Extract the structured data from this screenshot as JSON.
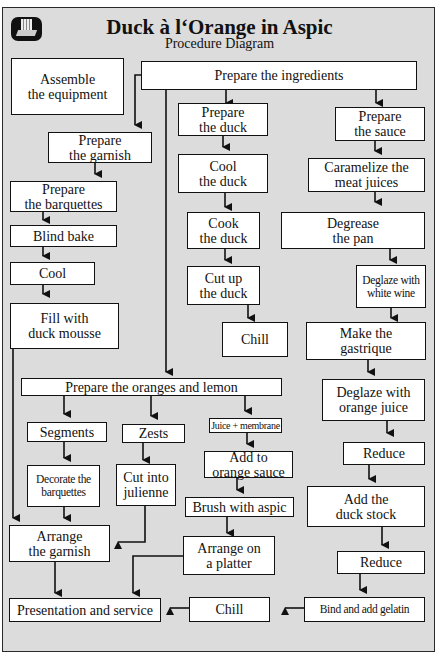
{
  "header": {
    "title": "Duck à l‘Orange in Aspic",
    "subtitle": "Procedure Diagram",
    "logo_icon": "chef-logo-icon"
  },
  "steps": {
    "assemble_equipment": "Assemble\nthe equipment",
    "prepare_ingredients": "Prepare the ingredients",
    "prepare_garnish": "Prepare\nthe garnish",
    "prepare_barquettes": "Prepare\nthe barquettes",
    "blind_bake": "Blind bake",
    "cool": "Cool",
    "fill_mousse": "Fill with\nduck mousse",
    "prepare_duck": "Prepare\nthe duck",
    "cool_duck": "Cool\nthe duck",
    "cook_duck": "Cook\nthe duck",
    "cut_duck": "Cut up\nthe duck",
    "chill_duck": "Chill",
    "prepare_sauce": "Prepare\nthe sauce",
    "caramelize": "Caramelize the\nmeat juices",
    "degrease": "Degrease\nthe pan",
    "deglaze_wine": "Deglaze with\nwhite wine",
    "gastrique": "Make the\ngastrique",
    "deglaze_orange": "Deglaze with\norange juice",
    "reduce_1": "Reduce",
    "add_stock": "Add the\nduck stock",
    "reduce_2": "Reduce",
    "bind_gelatin": "Bind and add gelatin",
    "chill_final": "Chill",
    "prepare_oranges": "Prepare the oranges and lemon",
    "segments": "Segments",
    "zests": "Zests",
    "juice_membrane": "Juice + membrane",
    "decorate_barquettes": "Decorate the\nbarquettes",
    "julienne": "Cut into\njulienne",
    "add_orange_sauce": "Add to\norange sauce",
    "brush_aspic": "Brush with aspic",
    "arrange_garnish": "Arrange\nthe garnish",
    "arrange_platter": "Arrange on\na platter",
    "presentation": "Presentation and service"
  },
  "colors": {
    "background": "#dcdcdc",
    "box_fill": "#ffffff",
    "line": "#111111"
  }
}
